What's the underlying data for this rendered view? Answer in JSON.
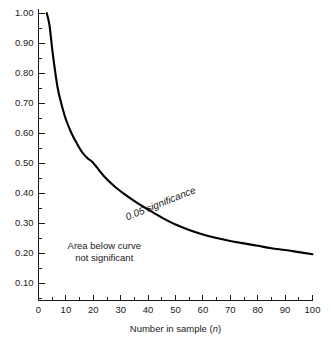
{
  "chart_data": {
    "type": "line",
    "title": "",
    "xlabel": "Number in sample (n)",
    "ylabel": "",
    "xlim": [
      0,
      100
    ],
    "ylim": [
      0.0,
      1.0
    ],
    "grid": false,
    "legend": "none",
    "x_ticks": [
      "0",
      "10",
      "20",
      "30",
      "40",
      "50",
      "60",
      "70",
      "80",
      "90",
      "100"
    ],
    "x_tick_values": [
      0,
      10,
      20,
      30,
      40,
      50,
      60,
      70,
      80,
      90,
      100
    ],
    "x_minor_tick_values": [
      5,
      15,
      25,
      35,
      45,
      55,
      65,
      75,
      85,
      95
    ],
    "y_ticks": [
      "1.00",
      "0.90",
      "0.80",
      "0.70",
      "0.60",
      "0.50",
      "0.40",
      "0.30",
      "0.20",
      "0.10"
    ],
    "y_tick_values": [
      1.0,
      0.9,
      0.8,
      0.7,
      0.6,
      0.5,
      0.4,
      0.3,
      0.2,
      0.1
    ],
    "y_minor_tick_values": [
      0.95,
      0.85,
      0.75,
      0.65,
      0.55,
      0.45,
      0.35,
      0.25,
      0.15,
      0.05
    ],
    "series": [
      {
        "name": "0.05 significance",
        "color": "#000000",
        "x": [
          3,
          4,
          5,
          6,
          7,
          8,
          9,
          10,
          12,
          14,
          16,
          18,
          20,
          24,
          28,
          32,
          36,
          40,
          45,
          50,
          55,
          60,
          65,
          70,
          75,
          80,
          85,
          90,
          95,
          100
        ],
        "y": [
          1.0,
          0.96,
          0.88,
          0.81,
          0.75,
          0.71,
          0.675,
          0.645,
          0.6,
          0.565,
          0.535,
          0.515,
          0.5,
          0.455,
          0.42,
          0.392,
          0.367,
          0.345,
          0.318,
          0.295,
          0.277,
          0.262,
          0.25,
          0.24,
          0.232,
          0.224,
          0.216,
          0.21,
          0.203,
          0.196
        ]
      }
    ],
    "annotations": [
      {
        "name": "curve-label",
        "text": "0.05 significance",
        "x": 45,
        "y": 0.355,
        "rotation": -22,
        "style": "italic"
      },
      {
        "name": "region-label",
        "lines": [
          "Area below curve",
          "not significant"
        ],
        "x": 24,
        "y": 0.215
      }
    ]
  },
  "colors": {
    "curve": "#000000",
    "axis": "#1a1a1a",
    "text": "#1a1a1a",
    "background": "#ffffff"
  }
}
